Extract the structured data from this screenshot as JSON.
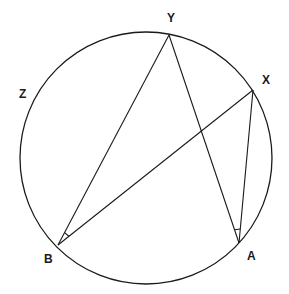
{
  "diagram": {
    "type": "circle-geometry",
    "stroke_color": "#1a1a1a",
    "circle": {
      "cx": 146,
      "cy": 158,
      "r": 126
    },
    "points": {
      "Y": {
        "x": 169,
        "y": 35,
        "label": "Y",
        "label_x": 167,
        "label_y": 12
      },
      "X": {
        "x": 253,
        "y": 90,
        "label": "X",
        "label_x": 262,
        "label_y": 74
      },
      "Z": {
        "label": "Z",
        "label_x": 19,
        "label_y": 88
      },
      "B": {
        "x": 58,
        "y": 245,
        "label": "B",
        "label_x": 44,
        "label_y": 253
      },
      "A": {
        "x": 239,
        "y": 243,
        "label": "A",
        "label_x": 247,
        "label_y": 250
      }
    },
    "segments": [
      {
        "from": "B",
        "to": "Y"
      },
      {
        "from": "B",
        "to": "X"
      },
      {
        "from": "Y",
        "to": "A"
      },
      {
        "from": "X",
        "to": "A"
      }
    ],
    "angle_marks": [
      {
        "vertex": "B",
        "between": [
          "Y",
          "X"
        ]
      },
      {
        "vertex": "A",
        "between": [
          "Y",
          "X"
        ]
      }
    ]
  }
}
